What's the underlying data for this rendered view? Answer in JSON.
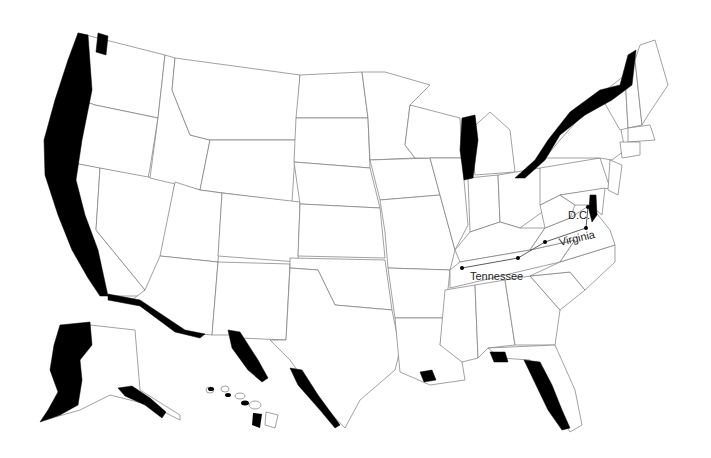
{
  "map": {
    "title": "United States state outline map with shaded border and coastal bands",
    "colors": {
      "background": "#ffffff",
      "state_fill": "#ffffff",
      "state_border": "#7a7a7a",
      "band": "#000000",
      "label": "#222222"
    },
    "labels": {
      "dc": "D.C.",
      "virginia": "Virginia",
      "tennessee": "Tennessee"
    },
    "shaded_regions": [
      "Pacific coast (Washington, Oregon, California)",
      "Puget Sound",
      "US–Mexico border (California/Arizona)",
      "US–Mexico border (New Mexico/Texas)",
      "Lake Michigan",
      "Great Lakes / St. Lawrence border (New York, Vermont)",
      "Maine–Canada border",
      "Gulf coast (Louisiana, Alabama/Florida panhandle)",
      "Florida Gulf coast",
      "Chesapeake Bay",
      "Alaska west coast",
      "Alaska southern coast",
      "Hawaii islands"
    ],
    "points": [
      "D.C.",
      "Virginia point",
      "Tennessee west point",
      "Tennessee mid point",
      "Kentucky/Virginia point"
    ]
  }
}
